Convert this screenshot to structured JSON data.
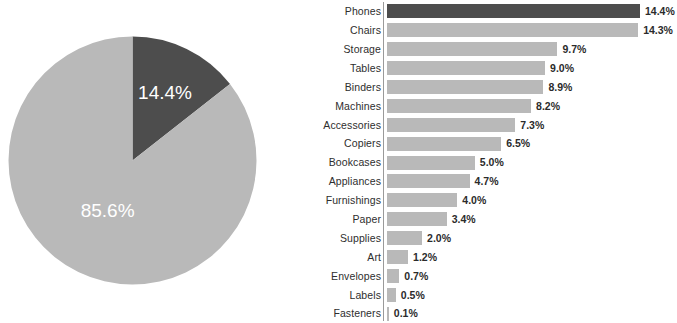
{
  "colors": {
    "highlight": "#4d4d4d",
    "base": "#b9b9b9",
    "axis": "#9a9a9a",
    "label_text": "#2e2e2e",
    "value_text": "#2b2b2b",
    "pie_label_text": "#ffffff",
    "background": "#ffffff"
  },
  "chart_data": [
    {
      "type": "pie",
      "title": "",
      "labels": [
        "Phones",
        "Other"
      ],
      "values": [
        14.4,
        85.6
      ],
      "value_labels": [
        "14.4%",
        "85.6%"
      ],
      "colors": [
        "#4d4d4d",
        "#b9b9b9"
      ],
      "start_angle_deg": 0,
      "direction": "clockwise",
      "legend": "none",
      "grid": false
    },
    {
      "type": "bar",
      "orientation": "horizontal",
      "title": "",
      "xlabel": "",
      "ylabel": "",
      "grid": false,
      "legend": "none",
      "xlim": [
        0,
        14.4
      ],
      "categories": [
        "Phones",
        "Chairs",
        "Storage",
        "Tables",
        "Binders",
        "Machines",
        "Accessories",
        "Copiers",
        "Bookcases",
        "Appliances",
        "Furnishings",
        "Paper",
        "Supplies",
        "Art",
        "Envelopes",
        "Labels",
        "Fasteners"
      ],
      "values": [
        14.4,
        14.3,
        9.7,
        9.0,
        8.9,
        8.2,
        7.3,
        6.5,
        5.0,
        4.7,
        4.0,
        3.4,
        2.0,
        1.2,
        0.7,
        0.5,
        0.1
      ],
      "value_labels": [
        "14.4%",
        "14.3%",
        "9.7%",
        "9.0%",
        "8.9%",
        "8.2%",
        "7.3%",
        "6.5%",
        "5.0%",
        "4.7%",
        "4.0%",
        "3.4%",
        "2.0%",
        "1.2%",
        "0.7%",
        "0.5%",
        "0.1%"
      ],
      "highlighted_category": "Phones"
    }
  ]
}
